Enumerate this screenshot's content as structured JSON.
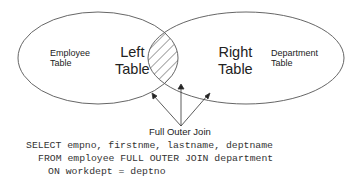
{
  "diagram": {
    "left_set": {
      "name": "Employee Table",
      "line1": "Employee",
      "line2": "Table",
      "role_line1": "Left",
      "role_line2": "Table"
    },
    "right_set": {
      "name": "Department Table",
      "line1": "Department",
      "line2": "Table",
      "role_line1": "Right",
      "role_line2": "Table"
    },
    "join_label": "Full Outer Join",
    "intersection_style": "hatched",
    "arrows_to": [
      "left-only region",
      "intersection",
      "right-only region"
    ]
  },
  "sql": {
    "line1": "SELECT empno, firstnme, lastname, deptname",
    "line2": "FROM employee FULL OUTER JOIN department",
    "line3": "ON workdept = deptno"
  },
  "colors": {
    "stroke": "#555555",
    "text": "#222222"
  }
}
